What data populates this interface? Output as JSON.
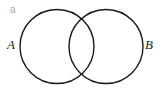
{
  "panel": {
    "label": "a"
  },
  "sets": [
    {
      "id": "A",
      "label": "A",
      "cx": 57,
      "cy": 46.5,
      "r": 37
    },
    {
      "id": "B",
      "label": "B",
      "cx": 106,
      "cy": 46.5,
      "r": 37
    }
  ],
  "style": {
    "stroke": "#1a1a1a",
    "stroke_width": 1.4,
    "fill": "none"
  }
}
